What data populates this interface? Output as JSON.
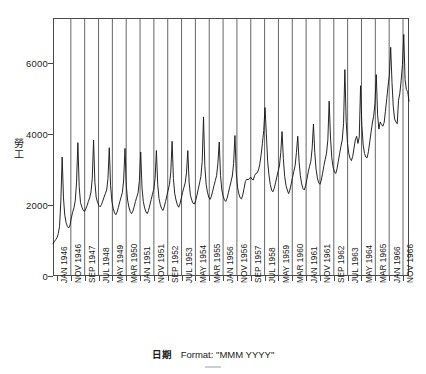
{
  "chart_data": {
    "type": "line",
    "title": "",
    "xlabel": "日期",
    "xlabel_format_note": "Format: \"MMM YYYY\"",
    "ylabel": "勞工",
    "ylim": [
      0,
      7200
    ],
    "y_ticks": [
      0,
      2000,
      4000,
      6000
    ],
    "y_tick_labels": [
      "0",
      "2000",
      "4000",
      "6000"
    ],
    "grid": "vertical-only",
    "legend": "none",
    "line_color": "#1a1a1a",
    "x_tick_labels": [
      "JAN 1946",
      "NOV 1946",
      "SEP 1947",
      "JUL 1948",
      "MAY 1949",
      "MAR 1950",
      "JAN 1951",
      "NOV 1951",
      "SEP 1952",
      "JUL 1953",
      "MAY 1954",
      "MAR 1955",
      "JAN 1956",
      "NOV 1956",
      "SEP 1957",
      "JUL 1958",
      "MAY 1959",
      "MAR 1960",
      "JAN 1961",
      "NOV 1961",
      "SEP 1962",
      "JUL 1963",
      "MAY 1964",
      "MAR 1965",
      "JAN 1966",
      "NOV 1966"
    ],
    "x_start": "JAN 1946",
    "x_end": "NOV 1966",
    "x_interval_months": 1,
    "n_points": 251,
    "values": [
      900,
      960,
      1010,
      1060,
      1180,
      1380,
      2100,
      3320,
      2180,
      1700,
      1490,
      1380,
      1340,
      1420,
      1620,
      1780,
      1900,
      2100,
      2620,
      3720,
      2500,
      2050,
      1930,
      1840,
      1800,
      1870,
      1960,
      2080,
      2180,
      2340,
      2720,
      3790,
      2620,
      2200,
      2060,
      1970,
      1930,
      1990,
      2090,
      2200,
      2300,
      2400,
      2720,
      3580,
      2520,
      2080,
      1890,
      1760,
      1710,
      1790,
      1920,
      2070,
      2200,
      2330,
      2680,
      3560,
      2520,
      2120,
      1920,
      1800,
      1740,
      1810,
      1930,
      2080,
      2200,
      2320,
      2660,
      3460,
      2460,
      2080,
      1900,
      1790,
      1740,
      1830,
      1980,
      2130,
      2280,
      2420,
      2720,
      3500,
      2560,
      2160,
      1990,
      1880,
      1830,
      1930,
      2080,
      2240,
      2400,
      2560,
      2900,
      3760,
      2720,
      2300,
      2120,
      1990,
      1920,
      2010,
      2170,
      2330,
      2470,
      2600,
      2880,
      3500,
      2620,
      2250,
      2120,
      2030,
      2010,
      2100,
      2260,
      2430,
      2600,
      2780,
      3200,
      4440,
      3080,
      2560,
      2340,
      2200,
      2140,
      2220,
      2370,
      2520,
      2660,
      2800,
      3150,
      3740,
      2800,
      2400,
      2230,
      2120,
      2080,
      2170,
      2320,
      2480,
      2630,
      2790,
      3140,
      3920,
      2900,
      2480,
      2290,
      2180,
      2150,
      2260,
      2450,
      2640,
      2700,
      2690,
      2710,
      2760,
      2700,
      2680,
      2800,
      2860,
      2880,
      2960,
      3120,
      3380,
      3700,
      4060,
      4700,
      3980,
      3200,
      2820,
      2560,
      2400,
      2350,
      2440,
      2600,
      2760,
      2920,
      3070,
      3440,
      4030,
      3280,
      2780,
      2530,
      2400,
      2300,
      2400,
      2570,
      2750,
      2920,
      3080,
      3450,
      3900,
      3200,
      2800,
      2570,
      2440,
      2400,
      2520,
      2700,
      2900,
      3060,
      3200,
      3560,
      4240,
      3450,
      2980,
      2740,
      2600,
      2560,
      2680,
      2870,
      3080,
      3260,
      3430,
      3800,
      4880,
      3880,
      3300,
      3040,
      2900,
      2860,
      2990,
      3200,
      3420,
      3620,
      3800,
      4250,
      5760,
      4320,
      3700,
      3420,
      3280,
      3220,
      3340,
      3570,
      3800,
      3900,
      3700,
      3880,
      5310,
      4200,
      3650,
      3420,
      3320,
      3300,
      3470,
      3740,
      4010,
      4270,
      4460,
      4820,
      5620,
      4500,
      4100,
      4300,
      4230,
      4180,
      4280,
      4600,
      4950,
      5300,
      5600,
      6380,
      5400,
      4720,
      4380,
      4300,
      4250,
      4900,
      5100,
      5450,
      5900,
      6740,
      5480,
      5200,
      5150,
      4880
    ]
  }
}
